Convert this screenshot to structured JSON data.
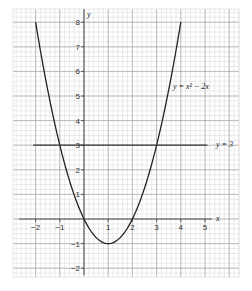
{
  "chart_data": {
    "type": "line",
    "title": "",
    "xlabel": "x",
    "ylabel": "y",
    "xlim": [
      -2.9,
      6.3
    ],
    "ylim": [
      -2.3,
      8.5
    ],
    "grid": true,
    "x_ticks": [
      "-2",
      "-1",
      "1",
      "2",
      "3",
      "4",
      "5"
    ],
    "y_ticks": [
      "-2",
      "-1",
      "1",
      "2",
      "3",
      "4",
      "5",
      "6",
      "7",
      "8"
    ],
    "series": [
      {
        "name": "y = x² − 2x",
        "label": "y = x² − 2x",
        "x": [
          -2,
          -1.5,
          -1,
          -0.5,
          0,
          0.5,
          1,
          1.5,
          2,
          2.5,
          3,
          3.5,
          4
        ],
        "values": [
          8,
          5.25,
          3,
          1.25,
          0,
          -0.75,
          -1,
          -0.75,
          0,
          1.25,
          3,
          5.25,
          8
        ]
      },
      {
        "name": "y = 3",
        "label": "y = 3",
        "x": [
          -2.1,
          5.1
        ],
        "values": [
          3,
          3
        ]
      }
    ],
    "annotations": [
      "y = x² − 2x",
      "y = 3"
    ]
  },
  "labels": {
    "x_axis": "x",
    "y_axis": "y",
    "curve": "y = x² − 2x",
    "line": "y = 3"
  },
  "colors": {
    "curve": "#222222",
    "line": "#333333",
    "grid_major": "#9a9a9a",
    "grid_minor": "#d6d6d6"
  }
}
